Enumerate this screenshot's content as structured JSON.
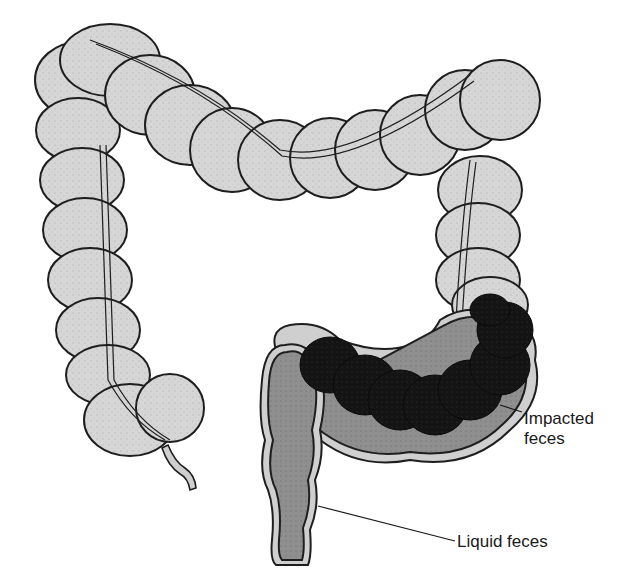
{
  "diagram": {
    "colors": {
      "colon_wall": "#d8d8d8",
      "outline": "#1e1e1e",
      "liquid_feces": "#8e8e8e",
      "impacted_feces": "#151515",
      "taenia_band": "#c8c8c8",
      "background": "#ffffff"
    },
    "labels": {
      "impacted_line1": "Impacted",
      "impacted_line2": "feces",
      "liquid": "Liquid feces"
    },
    "regions": [
      "ascending-colon",
      "transverse-colon",
      "descending-colon",
      "sigmoid-colon",
      "rectum",
      "appendix"
    ]
  }
}
